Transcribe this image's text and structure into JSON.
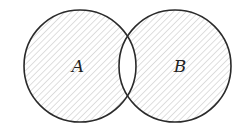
{
  "diagram": {
    "type": "venn",
    "shaded_region": "symmetric difference (A xor B)",
    "sets": [
      {
        "label": "A",
        "cx": 80,
        "cy": 66,
        "r": 56
      },
      {
        "label": "B",
        "cx": 175,
        "cy": 66,
        "r": 56
      }
    ],
    "intersection_shaded": false,
    "colors": {
      "outline": "#2a2a2a",
      "hatch": "#b8b8b8",
      "background": "#ffffff"
    }
  }
}
